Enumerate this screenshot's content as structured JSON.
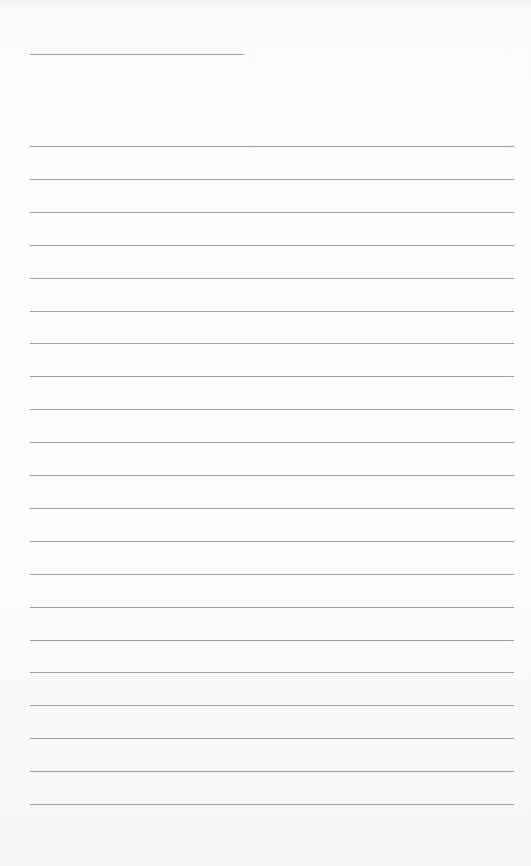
{
  "paper": {
    "background": "#fbfbfb",
    "line_color": "#8a8a8a",
    "title_line": {
      "top": 54,
      "left": 30,
      "width": 214
    },
    "ruled_lines": {
      "count": 21,
      "first_top": 146,
      "spacing": 32.9,
      "left": 30,
      "width": 484
    }
  }
}
